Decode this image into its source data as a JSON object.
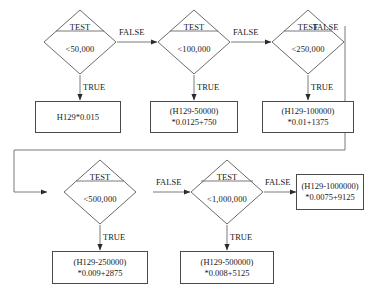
{
  "diagram": {
    "stroke_color": "#4a4a4a",
    "text_color": "#1a1a1a",
    "background": "#ffffff",
    "labels": {
      "true": "TRUE",
      "false": "FALSE",
      "test": "TEST"
    },
    "nodes": [
      {
        "id": "d1",
        "type": "decision",
        "test": "TEST",
        "condition": "<50,000"
      },
      {
        "id": "d2",
        "type": "decision",
        "test": "TEST",
        "condition": "<100,000"
      },
      {
        "id": "d3",
        "type": "decision",
        "test": "TEST",
        "condition": "<250,000"
      },
      {
        "id": "d4",
        "type": "decision",
        "test": "TEST",
        "condition": "<500,000"
      },
      {
        "id": "d5",
        "type": "decision",
        "test": "TEST",
        "condition": "<1,000,000"
      },
      {
        "id": "r1",
        "type": "result",
        "line1": "H129*0.015",
        "line2": ""
      },
      {
        "id": "r2",
        "type": "result",
        "line1": "(H129-50000)",
        "line2": "*0.0125+750"
      },
      {
        "id": "r3",
        "type": "result",
        "line1": "(H129-100000)",
        "line2": "*0.01+1375"
      },
      {
        "id": "r4",
        "type": "result",
        "line1": "(H129-250000)",
        "line2": "*0.009+2875"
      },
      {
        "id": "r5",
        "type": "result",
        "line1": "(H129-500000)",
        "line2": "*0.008+5125"
      },
      {
        "id": "r6",
        "type": "result",
        "line1": "(H129-1000000)",
        "line2": "*0.0075+9125"
      }
    ],
    "edges": [
      {
        "from": "d1",
        "to": "d2",
        "label": "FALSE"
      },
      {
        "from": "d2",
        "to": "d3",
        "label": "FALSE"
      },
      {
        "from": "d3",
        "to": "d4",
        "label": "FALSE"
      },
      {
        "from": "d4",
        "to": "d5",
        "label": "FALSE"
      },
      {
        "from": "d5",
        "to": "r6",
        "label": "FALSE"
      },
      {
        "from": "d1",
        "to": "r1",
        "label": "TRUE"
      },
      {
        "from": "d2",
        "to": "r2",
        "label": "TRUE"
      },
      {
        "from": "d3",
        "to": "r3",
        "label": "TRUE"
      },
      {
        "from": "d4",
        "to": "r4",
        "label": "TRUE"
      },
      {
        "from": "d5",
        "to": "r5",
        "label": "TRUE"
      }
    ]
  }
}
